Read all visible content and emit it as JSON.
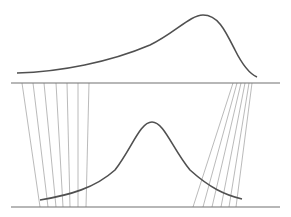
{
  "diagram": {
    "colors": {
      "background": "#ffffff",
      "axis": "#707070",
      "curve": "#505050",
      "projection_line": "#a8a8a8"
    },
    "top_panel": {
      "axis": {
        "x1": 11,
        "x2": 280,
        "y": 83
      },
      "curve_type": "skewed-left distribution",
      "curve_path": "M17,73 C60,72 110,62 150,45 C175,33 190,15 203,15 C218,15 225,30 235,50 C243,66 250,74 257,77"
    },
    "bottom_panel": {
      "axis": {
        "x1": 11,
        "x2": 280,
        "y": 207
      },
      "curve_type": "symmetric bell distribution",
      "curve_path": "M40,200 C70,195 95,188 115,170 C132,148 140,122 152,122 C164,122 172,148 190,170 C210,188 225,195 242,199"
    },
    "projection_lines": {
      "left": [
        {
          "x1": 22,
          "y1": 83,
          "x2": 40,
          "y2": 207
        },
        {
          "x1": 33,
          "y1": 83,
          "x2": 48,
          "y2": 207
        },
        {
          "x1": 44,
          "y1": 83,
          "x2": 56,
          "y2": 207
        },
        {
          "x1": 56,
          "y1": 83,
          "x2": 63,
          "y2": 207
        },
        {
          "x1": 67,
          "y1": 83,
          "x2": 70,
          "y2": 207
        },
        {
          "x1": 78,
          "y1": 83,
          "x2": 78,
          "y2": 207
        },
        {
          "x1": 89,
          "y1": 83,
          "x2": 86,
          "y2": 207
        }
      ],
      "right": [
        {
          "x1": 233,
          "y1": 83,
          "x2": 193,
          "y2": 207
        },
        {
          "x1": 237,
          "y1": 83,
          "x2": 203,
          "y2": 207
        },
        {
          "x1": 241,
          "y1": 83,
          "x2": 212,
          "y2": 207
        },
        {
          "x1": 245,
          "y1": 83,
          "x2": 221,
          "y2": 207
        },
        {
          "x1": 249,
          "y1": 83,
          "x2": 229,
          "y2": 207
        },
        {
          "x1": 252,
          "y1": 83,
          "x2": 236,
          "y2": 207
        }
      ]
    }
  }
}
